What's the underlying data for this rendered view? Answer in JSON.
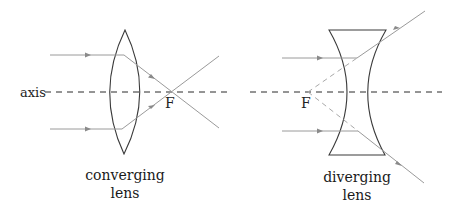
{
  "diagram": {
    "axis_label": "axis",
    "converging": {
      "focal_label": "F",
      "caption_line1": "converging",
      "caption_line2": "lens"
    },
    "diverging": {
      "focal_label": "F",
      "caption_line1": "diverging",
      "caption_line2": "lens"
    }
  },
  "colors": {
    "lens_stroke": "#3a3a3a",
    "ray_stroke": "#9a9a9a",
    "axis_stroke": "#2a2a2a",
    "background": "#ffffff"
  }
}
